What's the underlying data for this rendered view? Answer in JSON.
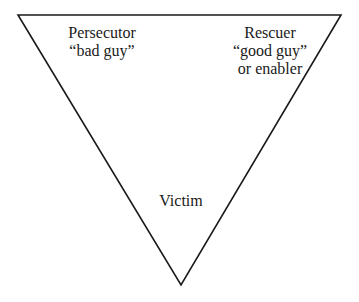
{
  "diagram": {
    "type": "inverted-triangle",
    "stroke_color": "#1a1a1a",
    "vertices": {
      "top_left": [
        18,
        15
      ],
      "top_right": [
        341,
        15
      ],
      "bottom": [
        181,
        285
      ]
    },
    "roles": {
      "persecutor": {
        "title": "Persecutor",
        "subtitle": "“bad guy”"
      },
      "rescuer": {
        "title": "Rescuer",
        "subtitle": "“good guy”",
        "extra": "or enabler"
      },
      "victim": {
        "title": "Victim"
      }
    }
  }
}
